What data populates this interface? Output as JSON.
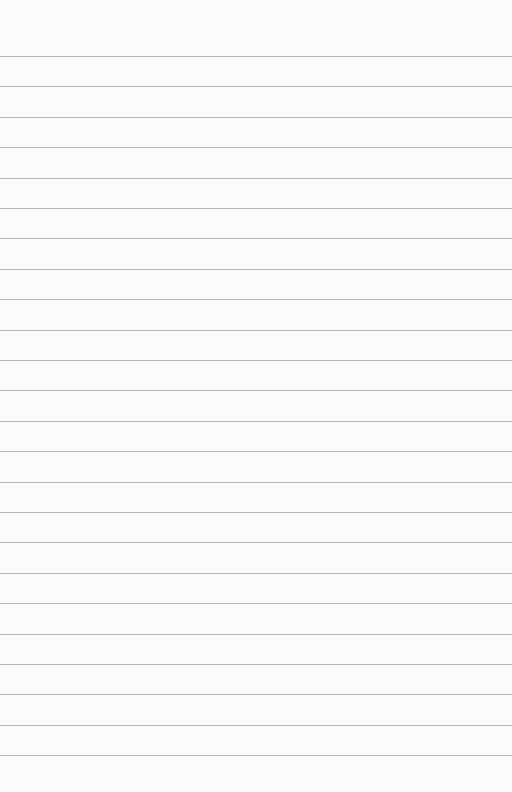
{
  "paper": {
    "type": "lined-notepad",
    "background_color": "#fbfbfb",
    "line_color": "#a9a9a9",
    "line_count": 24,
    "first_line_y": 56,
    "line_spacing": 30.4,
    "text": ""
  }
}
